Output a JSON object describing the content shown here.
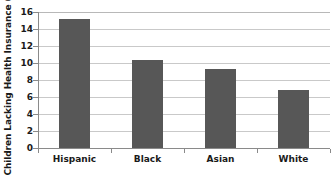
{
  "chart_data": {
    "type": "bar",
    "title": "",
    "subtitle": "",
    "xlabel": "",
    "ylabel": "Children Lacking Health Insurance (%)",
    "categories": [
      "Hispanic",
      "Black",
      "Asian",
      "White"
    ],
    "values": [
      15.2,
      10.3,
      9.3,
      6.8
    ],
    "ylim": [
      0,
      16
    ],
    "ytick_values": [
      0,
      2,
      4,
      6,
      8,
      10,
      12,
      14,
      16
    ],
    "ytick_labels": [
      "0",
      "2",
      "4",
      "6",
      "8",
      "10",
      "12",
      "14",
      "16"
    ],
    "grid": true,
    "grid_axis": "y",
    "legend": false,
    "legend_position": "none",
    "bar_color": "#575757",
    "gridline_color": "#c9c9c9",
    "axis_color": "#8a8a8a",
    "text_color": "#1a1a1a"
  }
}
